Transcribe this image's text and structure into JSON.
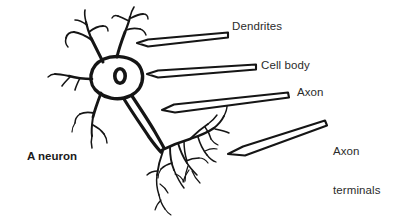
{
  "figure": {
    "caption": "A neuron",
    "background_color": "#ffffff",
    "ink_color": "#1a1a1a",
    "text_color": "#2b2b2b"
  },
  "labels": {
    "dendrites": "Dendrites",
    "cell_body": "Cell body",
    "axon": "Axon",
    "axon_terminals_line1": "Axon",
    "axon_terminals_line2": "terminals"
  },
  "diagram": {
    "type": "labeled-biological-illustration",
    "subject": "neuron",
    "parts": [
      {
        "name": "dendrites",
        "label": "Dendrites",
        "arrow": "horizontal-left"
      },
      {
        "name": "cell-body",
        "label": "Cell body",
        "arrow": "horizontal-left"
      },
      {
        "name": "axon",
        "label": "Axon",
        "arrow": "horizontal-left"
      },
      {
        "name": "axon-terminals",
        "label": "Axon terminals",
        "arrow": "diagonal-down-left"
      }
    ]
  }
}
